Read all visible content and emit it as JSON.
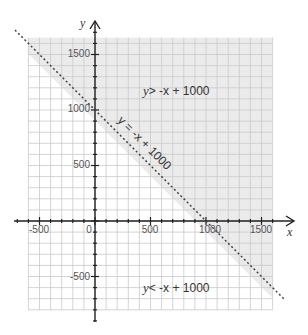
{
  "chart_data": {
    "type": "inequality-graph",
    "title": "",
    "xlabel": "x",
    "ylabel": "y",
    "xlim": [
      -600,
      1600
    ],
    "ylim": [
      -800,
      1650
    ],
    "grid": true,
    "grid_step": 100,
    "x_ticks": [
      -500,
      0,
      500,
      1000,
      1500
    ],
    "y_ticks": [
      -500,
      500,
      1000,
      1500
    ],
    "x_tick_labels": [
      "-500",
      "0",
      "500",
      "1000",
      "1500"
    ],
    "y_tick_labels": [
      "-500",
      "500",
      "1000",
      "1500"
    ],
    "boundary_line": {
      "equation": "y = -x + 1000",
      "slope": -1,
      "intercept": 1000,
      "style": "dashed",
      "points": [
        [
          -600,
          1600
        ],
        [
          1700,
          -700
        ]
      ]
    },
    "regions": [
      {
        "label": "y > -x + 1000",
        "shaded": true,
        "side": "above"
      },
      {
        "label": "y < -x + 1000",
        "shaded": false,
        "side": "below"
      }
    ],
    "annotations": [
      {
        "text": "y = -x + 1000",
        "rotation": 45,
        "position": "along boundary line"
      },
      {
        "text": "y > -x + 1000",
        "x": 600,
        "y": 1150
      },
      {
        "text": "y < -x + 1000",
        "x": 600,
        "y": -600
      }
    ],
    "colors": {
      "shaded_region": "#ebebeb",
      "grid": "#c9c9c9",
      "axis": "#222222",
      "boundary": "#444444"
    }
  },
  "labels": {
    "x_axis": "x",
    "y_axis": "y",
    "origin": "0",
    "boundary": "y = -x + 1000",
    "above_var": "y",
    "above_rest": "> -x + 1000",
    "below_var": "y",
    "below_rest": "< -x + 1000",
    "xt_m500": "-500",
    "xt_500": "500",
    "xt_1000": "1000",
    "xt_1500": "1500",
    "yt_m500": "-500",
    "yt_500": "500",
    "yt_1000": "1000",
    "yt_1500": "1500"
  }
}
